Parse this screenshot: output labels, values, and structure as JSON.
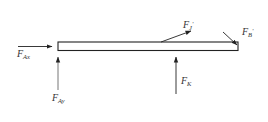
{
  "diagram": {
    "type": "free-body diagram",
    "colors": {
      "line": "#222222",
      "background": "#ffffff"
    },
    "forces": [
      {
        "id": "F_Ax",
        "base": "F",
        "sub": "Ax",
        "sup": "",
        "direction": "right",
        "at": "left end"
      },
      {
        "id": "F_Ay",
        "base": "F",
        "sub": "Ay",
        "sup": "",
        "direction": "up",
        "at": "left end"
      },
      {
        "id": "F_J'",
        "base": "F",
        "sub": "J",
        "sup": "'",
        "direction": "up-right",
        "at": "top middle"
      },
      {
        "id": "F_B'",
        "base": "F",
        "sub": "B",
        "sup": "'",
        "direction": "down-right",
        "at": "right end"
      },
      {
        "id": "F_K",
        "base": "F",
        "sub": "K",
        "sup": "",
        "direction": "up",
        "at": "bottom right of middle"
      }
    ]
  }
}
